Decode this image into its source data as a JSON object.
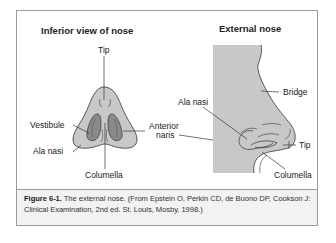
{
  "figure": {
    "left_panel": {
      "title": "Inferior view of nose",
      "labels": {
        "tip": "Tip",
        "vestibule": "Vestibule",
        "ala_nasi": "Ala nasi",
        "columella": "Columella"
      }
    },
    "center_label": {
      "line1": "Anterior",
      "line2": "naris"
    },
    "right_panel": {
      "title": "External nose",
      "labels": {
        "ala_nasi": "Ala nasi",
        "bridge": "Bridge",
        "tip": "Tip",
        "columella": "Columella"
      }
    },
    "caption": {
      "label": "Figure 6-1.",
      "text": " The external nose. (From Epstein O, Perkin CD, de Buono DP, Cookson J: Clinical Examination, 2nd ed. St. Louis, Mosby, 1998.)"
    },
    "colors": {
      "skin_fill": "#c8c8c8",
      "nostril_fill": "#8a8a8a",
      "line": "#333333",
      "frame_border": "#9a9a9a",
      "caption_bg": "#f2f2f2"
    }
  }
}
